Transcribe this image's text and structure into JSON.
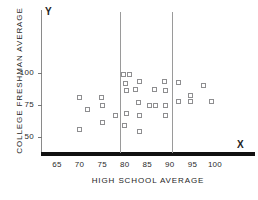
{
  "chart_data": {
    "type": "scatter",
    "title": "",
    "xlabel": "HIGH SCHOOL AVERAGE",
    "ylabel": "COLLEGE FRESHMAN AVERAGE",
    "x_axis_letter": "X",
    "y_axis_letter": "Y",
    "xlim": [
      62,
      105
    ],
    "ylim": [
      38,
      110
    ],
    "grid": false,
    "legend": null,
    "xticks": [
      65,
      70,
      75,
      80,
      85,
      90,
      95,
      100
    ],
    "yticks": [
      50,
      75,
      100
    ],
    "xtick_labels": [
      "65",
      "70",
      "75",
      "80",
      "85",
      "90",
      "95",
      "100"
    ],
    "ytick_labels": [
      "50",
      "75",
      "100"
    ],
    "reference_lines": {
      "orientation": "vertical",
      "values": [
        79,
        90.5
      ],
      "color": "#9a9a9a"
    },
    "marker": {
      "shape": "open-square",
      "edge_color": "#8e8e90",
      "fill_color": "#ffffff",
      "size_px": 5
    },
    "points": [
      {
        "x": 70.0,
        "y": 80.5
      },
      {
        "x": 70.0,
        "y": 56.0
      },
      {
        "x": 71.8,
        "y": 71.5
      },
      {
        "x": 74.8,
        "y": 80.5
      },
      {
        "x": 75.0,
        "y": 75.0
      },
      {
        "x": 75.1,
        "y": 61.5
      },
      {
        "x": 78.0,
        "y": 66.5
      },
      {
        "x": 79.8,
        "y": 99.0
      },
      {
        "x": 81.0,
        "y": 99.0
      },
      {
        "x": 80.2,
        "y": 92.0
      },
      {
        "x": 80.5,
        "y": 86.5
      },
      {
        "x": 80.3,
        "y": 68.0
      },
      {
        "x": 80.0,
        "y": 59.0
      },
      {
        "x": 82.3,
        "y": 87.0
      },
      {
        "x": 83.3,
        "y": 93.0
      },
      {
        "x": 83.0,
        "y": 77.0
      },
      {
        "x": 83.2,
        "y": 67.0
      },
      {
        "x": 83.3,
        "y": 54.5
      },
      {
        "x": 85.6,
        "y": 74.5
      },
      {
        "x": 86.5,
        "y": 87.0
      },
      {
        "x": 86.8,
        "y": 74.5
      },
      {
        "x": 88.8,
        "y": 93.5
      },
      {
        "x": 89.0,
        "y": 86.5
      },
      {
        "x": 89.0,
        "y": 75.0
      },
      {
        "x": 89.0,
        "y": 66.5
      },
      {
        "x": 92.0,
        "y": 92.5
      },
      {
        "x": 92.0,
        "y": 78.0
      },
      {
        "x": 94.5,
        "y": 82.5
      },
      {
        "x": 94.6,
        "y": 77.5
      },
      {
        "x": 97.5,
        "y": 90.5
      },
      {
        "x": 99.3,
        "y": 77.5
      }
    ]
  }
}
